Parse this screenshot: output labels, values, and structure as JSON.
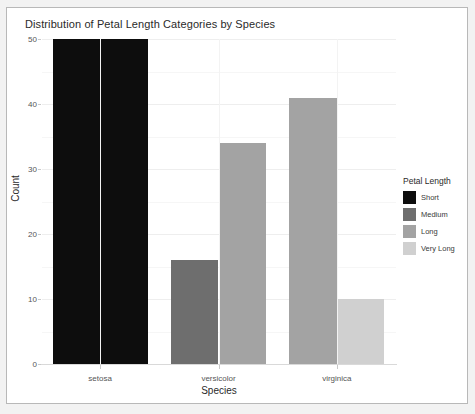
{
  "chart_data": {
    "type": "bar",
    "title": "Distribution of Petal Length Categories by Species",
    "xlabel": "Species",
    "ylabel": "Count",
    "categories": [
      "setosa",
      "versicolor",
      "virginica"
    ],
    "series": [
      {
        "name": "Short",
        "color": "#0d0d0d",
        "values": [
          50,
          0,
          0
        ]
      },
      {
        "name": "Medium",
        "color": "#6e6e6e",
        "values": [
          0,
          16,
          0
        ]
      },
      {
        "name": "Long",
        "color": "#a3a3a3",
        "values": [
          0,
          34,
          41
        ]
      },
      {
        "name": "Very Long",
        "color": "#d0d0d0",
        "values": [
          0,
          0,
          10
        ]
      }
    ],
    "ylim": [
      0,
      50
    ],
    "yticks": [
      0,
      10,
      20,
      30,
      40,
      50
    ],
    "ytick_labels": [
      "0",
      "10",
      "20",
      "30",
      "40",
      "50"
    ],
    "grid": true,
    "legend": {
      "title": "Petal Length",
      "position": "right"
    }
  },
  "legend": {
    "title": "Petal Length",
    "entries": [
      {
        "label": "Short",
        "color": "#0d0d0d"
      },
      {
        "label": "Medium",
        "color": "#6e6e6e"
      },
      {
        "label": "Long",
        "color": "#a3a3a3"
      },
      {
        "label": "Very Long",
        "color": "#d0d0d0"
      }
    ]
  },
  "axes": {
    "x_title": "Species",
    "y_title": "Count",
    "x_labels": [
      "setosa",
      "versicolor",
      "virginica"
    ],
    "y_labels": [
      "0",
      "10",
      "20",
      "30",
      "40",
      "50"
    ]
  },
  "colors": {
    "panel_background": "#ffffff",
    "grid": "#eeeeee",
    "frame_border": "#b8b8b8",
    "text": "#2a2a2a",
    "tick_text": "#555555"
  }
}
